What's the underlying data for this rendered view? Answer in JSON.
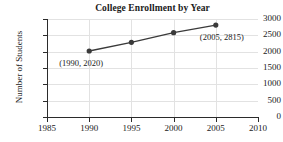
{
  "chart_data": {
    "type": "line",
    "title": "College Enrollment by Year",
    "xlabel": "",
    "ylabel": "Number of Students",
    "x": [
      1990,
      1995,
      2000,
      2005
    ],
    "values": [
      2020,
      2285,
      2580,
      2815
    ],
    "series": [
      {
        "name": "Enrollment",
        "x": [
          1990,
          1995,
          2000,
          2005
        ],
        "values": [
          2020,
          2285,
          2580,
          2815
        ]
      }
    ],
    "xlim": [
      1985,
      2010
    ],
    "ylim": [
      0,
      3000
    ],
    "xticks": [
      1985,
      1990,
      1995,
      2000,
      2005,
      2010
    ],
    "yticks": [
      0,
      500,
      1000,
      1500,
      2000,
      2500,
      3000
    ],
    "xtick_labels": [
      "1985",
      "1990",
      "1995",
      "2000",
      "2005",
      "2010"
    ],
    "ytick_labels": [
      "0",
      "500",
      "1000",
      "1500",
      "2000",
      "2500",
      "3000"
    ],
    "grid": true,
    "legend": false,
    "annotations": [
      {
        "text": "(1990, 2020)",
        "x": 1990,
        "y": 2020
      },
      {
        "text": "(2005, 2815)",
        "x": 2005,
        "y": 2815
      }
    ],
    "colors": {
      "line": "#3a3a3a",
      "marker": "#3a3a3a",
      "axis": "#2b2b2b",
      "grid": "#e2e2e2",
      "text": "#1a1a1a",
      "background": "#ffffff"
    }
  }
}
